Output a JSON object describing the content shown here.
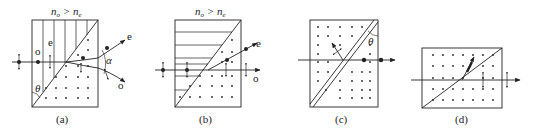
{
  "panels": [
    {
      "id": "a",
      "caption": "(a)",
      "condition": "n_o > n_e",
      "condition_parts": {
        "left": "n",
        "left_sub": "o",
        "op": ">",
        "right": "n",
        "right_sub": "e"
      },
      "labels": {
        "o_ray": "o",
        "e_ray": "e",
        "out_e": "e",
        "out_o": "o",
        "angle_alpha": "α",
        "angle_theta": "θ"
      }
    },
    {
      "id": "b",
      "caption": "(b)",
      "condition": "n_o > n_e",
      "condition_parts": {
        "left": "n",
        "left_sub": "o",
        "op": ">",
        "right": "n",
        "right_sub": "e"
      },
      "labels": {
        "out_e": "e",
        "out_o": "o"
      }
    },
    {
      "id": "c",
      "caption": "(c)",
      "labels": {
        "angle_theta": "θ"
      }
    },
    {
      "id": "d",
      "caption": "(d)",
      "labels": {}
    }
  ],
  "colors": {
    "ink": "#222222",
    "background": "#ffffff"
  }
}
